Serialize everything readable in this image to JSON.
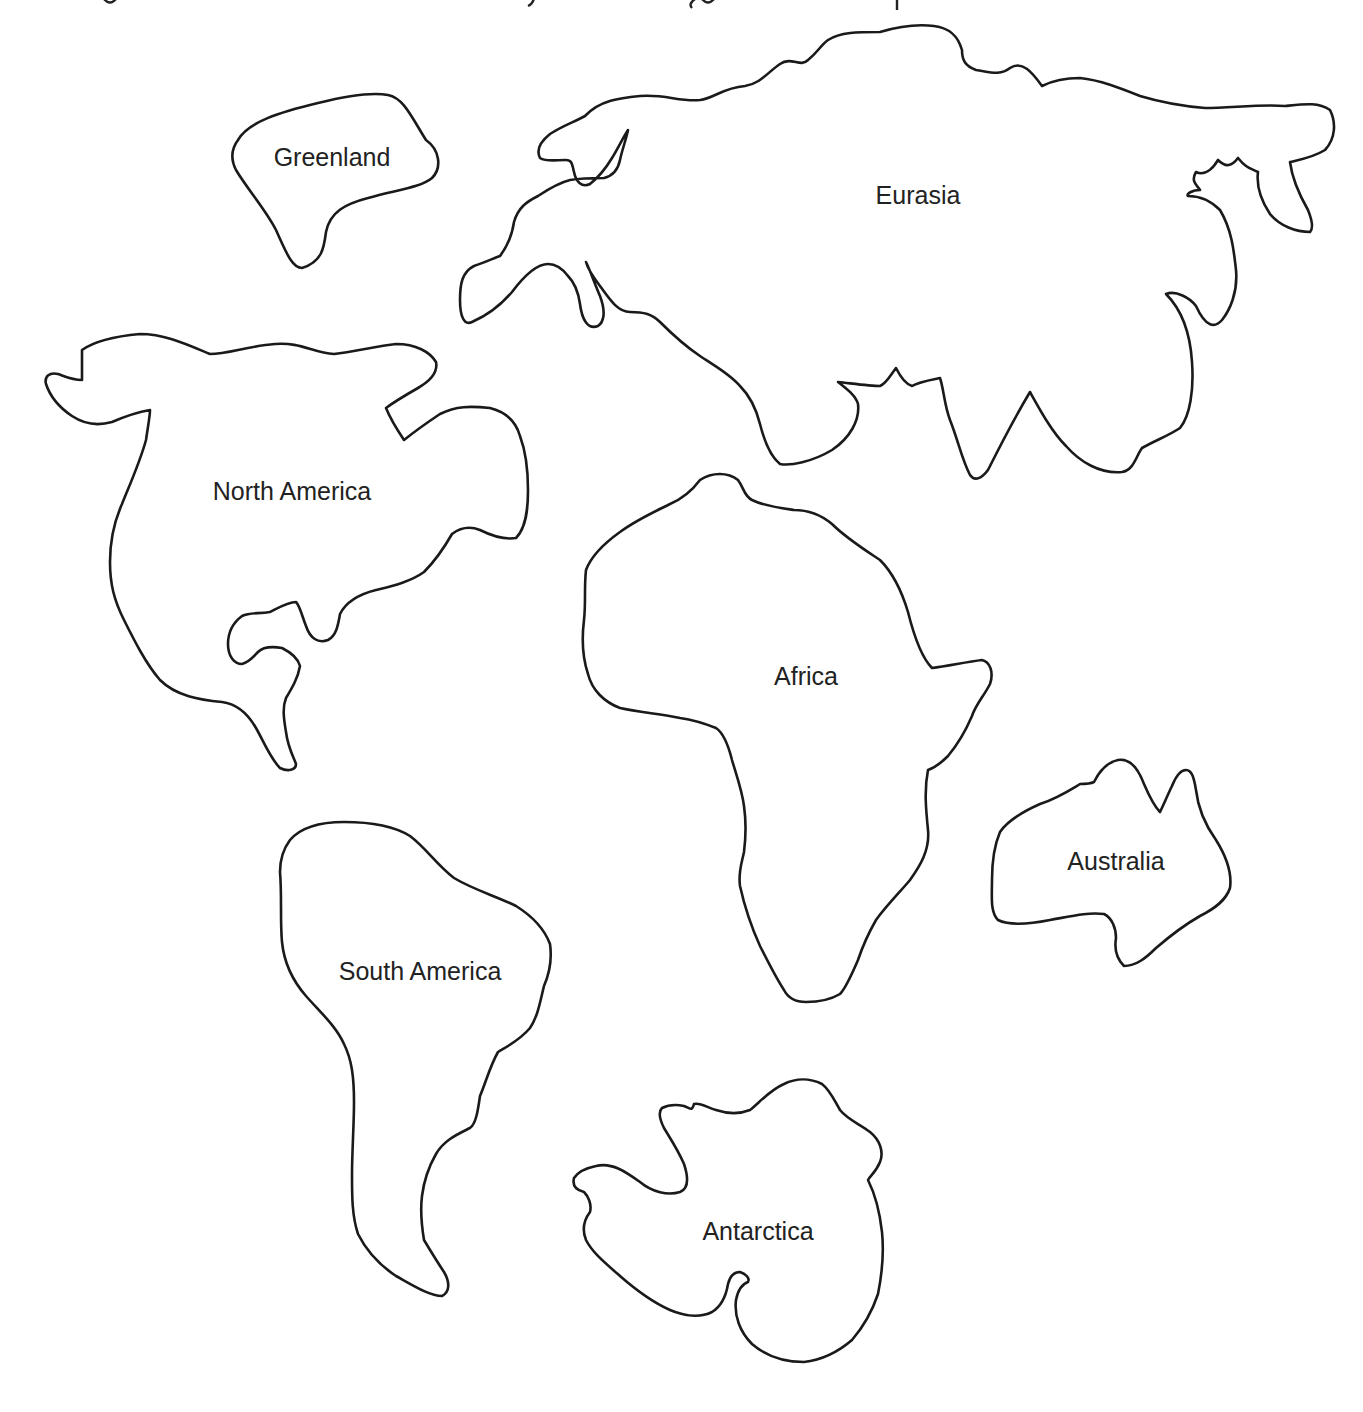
{
  "worksheet": {
    "top_line_note": "cropped line of text at top edge; only descenders visible, unreadable",
    "outline_color": "#1a1a1a",
    "label_color": "#222222",
    "background_color": "#ffffff"
  },
  "continents": [
    {
      "id": "greenland",
      "label": "Greenland",
      "label_x": 332,
      "label_y": 157
    },
    {
      "id": "eurasia",
      "label": "Eurasia",
      "label_x": 918,
      "label_y": 195
    },
    {
      "id": "north-america",
      "label": "North America",
      "label_x": 292,
      "label_y": 491
    },
    {
      "id": "africa",
      "label": "Africa",
      "label_x": 806,
      "label_y": 676
    },
    {
      "id": "australia",
      "label": "Australia",
      "label_x": 1116,
      "label_y": 861
    },
    {
      "id": "south-america",
      "label": "South America",
      "label_x": 420,
      "label_y": 971
    },
    {
      "id": "antarctica",
      "label": "Antarctica",
      "label_x": 758,
      "label_y": 1231
    }
  ]
}
